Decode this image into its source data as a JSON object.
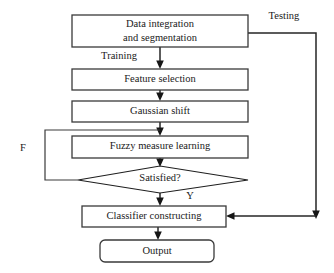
{
  "diagram": {
    "background_color": "#ffffff",
    "line_color": "#262626",
    "text_color": "#1a1a1a",
    "nodes": [
      {
        "id": "data-integration",
        "shape": "rectangle",
        "label_line1": "Data integration",
        "label_line2": "and segmentation"
      },
      {
        "id": "feature-selection",
        "shape": "rectangle",
        "label": "Feature selection"
      },
      {
        "id": "gaussian-shift",
        "shape": "rectangle",
        "label": "Gaussian shift"
      },
      {
        "id": "fuzzy-measure-learning",
        "shape": "rectangle",
        "label": "Fuzzy measure learning"
      },
      {
        "id": "satisfied",
        "shape": "diamond",
        "label": "Satisfied?"
      },
      {
        "id": "classifier-constructing",
        "shape": "rectangle",
        "label": "Classifier constructing"
      },
      {
        "id": "output",
        "shape": "rounded-rectangle",
        "label": "Output"
      }
    ],
    "edge_labels": {
      "testing": "Testing",
      "training": "Training",
      "false_branch": "F",
      "yes_branch": "Y"
    }
  }
}
